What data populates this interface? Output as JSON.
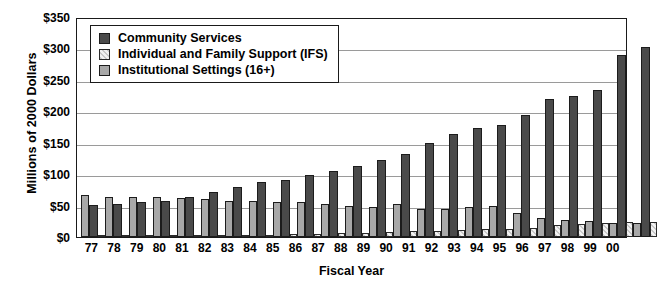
{
  "chart_data": {
    "type": "bar",
    "title": "",
    "xlabel": "Fiscal Year",
    "ylabel": "Millions of 2000 Dollars",
    "categories": [
      "77",
      "78",
      "79",
      "80",
      "81",
      "82",
      "83",
      "84",
      "85",
      "86",
      "87",
      "88",
      "89",
      "90",
      "91",
      "92",
      "93",
      "94",
      "95",
      "96",
      "97",
      "98",
      "99",
      "00"
    ],
    "ylim": [
      0,
      350
    ],
    "yticks": [
      "$0",
      "$50",
      "$100",
      "$150",
      "$200",
      "$250",
      "$300",
      "$350"
    ],
    "ytick_values": [
      0,
      50,
      100,
      150,
      200,
      250,
      300,
      350
    ],
    "grid": true,
    "legend_position": "top-left",
    "series": [
      {
        "name": "Community Services",
        "key": "cs",
        "color": "#4a4a4a",
        "values": [
          51,
          52,
          55,
          58,
          63,
          71,
          79,
          87,
          90,
          99,
          105,
          113,
          123,
          132,
          150,
          164,
          173,
          178,
          194,
          219,
          224,
          234,
          290,
          303
        ]
      },
      {
        "name": "Individual and Family Support (IFS)",
        "key": "ifs",
        "color": "#d8d8d8",
        "values": [
          2,
          2,
          2,
          3,
          3,
          3,
          4,
          4,
          5,
          5,
          6,
          7,
          8,
          9,
          10,
          11,
          12,
          13,
          15,
          19,
          21,
          22,
          24,
          24
        ]
      },
      {
        "name": "Institutional Settings (16+)",
        "key": "inst",
        "color": "#a8a8a8",
        "values": [
          67,
          64,
          64,
          64,
          62,
          60,
          58,
          57,
          56,
          55,
          52,
          50,
          48,
          52,
          45,
          44,
          47,
          49,
          38,
          30,
          27,
          25,
          22,
          22
        ]
      }
    ]
  }
}
